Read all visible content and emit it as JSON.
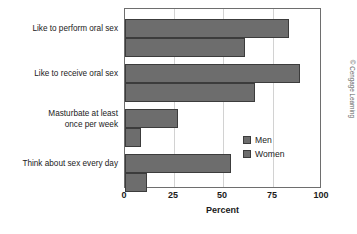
{
  "chart_data": {
    "type": "bar",
    "orientation": "horizontal",
    "title": "",
    "xlabel": "Percent",
    "ylabel": "",
    "xlim": [
      0,
      100
    ],
    "xticks": [
      "0",
      "25",
      "50",
      "75",
      "100"
    ],
    "grid": true,
    "legend_position": "inside-right",
    "categories": [
      "Like to perform oral sex",
      "Like to receive oral sex",
      "Masturbate at least\nonce per week",
      "Think about sex every day"
    ],
    "series": [
      {
        "name": "Men",
        "values": [
          83,
          89,
          27,
          54
        ],
        "color": "#6d6d6d"
      },
      {
        "name": "Women",
        "values": [
          61,
          66,
          8,
          11
        ],
        "color": "#6d6d6d"
      }
    ]
  },
  "legend": {
    "items": [
      {
        "label": "Men"
      },
      {
        "label": "Women"
      }
    ]
  },
  "credit": "© Cengage Learning",
  "colors": {
    "bar_fill": "#6d6d6d",
    "bar_stroke": "#3c3c3c",
    "gridline": "#d2d2d2",
    "frame": "#6e6e6e",
    "text": "#1a1a1a"
  }
}
